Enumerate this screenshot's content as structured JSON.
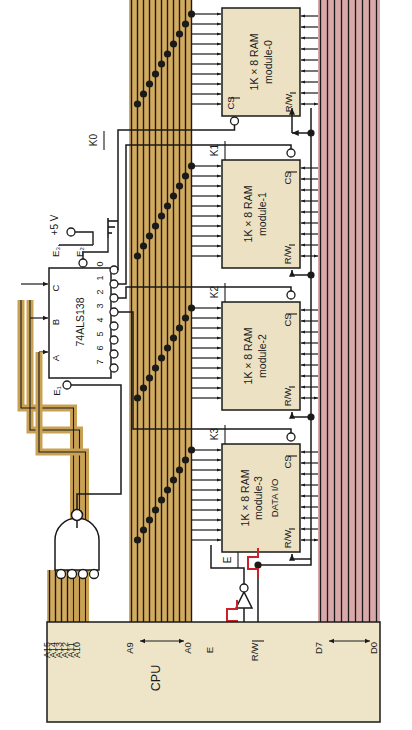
{
  "figure": {
    "type": "digital-logic-schematic",
    "orientation": "rotated 90 degrees counter-clockwise",
    "background_color": "#ffffff"
  },
  "colors": {
    "address_bus": "#d2ab5e",
    "address_bus_alt": "#c9a154",
    "data_bus": "#d9a8a8",
    "chip_fill": "#ede1c3",
    "cpu_fill": "#eee4c8",
    "wire": "#1a1a1a",
    "waveform": "#cc2127",
    "white": "#ffffff"
  },
  "cpu": {
    "label": "CPU",
    "address_high_pins": [
      "A15",
      "A14",
      "A13",
      "A12",
      "A11",
      "A10"
    ],
    "address_low_range": {
      "from": "A9",
      "to": "A0"
    },
    "control_pins": [
      "E",
      "R/W"
    ],
    "data_range": {
      "from": "D7",
      "to": "D0"
    }
  },
  "decoder": {
    "part": "74ALS138",
    "select_inputs": [
      "A",
      "B",
      "C"
    ],
    "enable_inputs": [
      "E1",
      "E2",
      "E3"
    ],
    "outputs": [
      "0",
      "1",
      "2",
      "3",
      "4",
      "5",
      "6",
      "7"
    ],
    "supply_label": "+5 V",
    "ground_label": "ground"
  },
  "select_lines": [
    {
      "name": "K0",
      "overbar": true
    },
    {
      "name": "K1",
      "overbar": true
    },
    {
      "name": "K2",
      "overbar": true
    },
    {
      "name": "K3",
      "overbar": true
    }
  ],
  "ram_modules": [
    {
      "title": "1K × 8 RAM",
      "subtitle": "module-0",
      "cs_pin": "CS",
      "rw_pin": "R/W",
      "data_label": ""
    },
    {
      "title": "1K × 8 RAM",
      "subtitle": "module-1",
      "cs_pin": "CS",
      "rw_pin": "R/W",
      "data_label": ""
    },
    {
      "title": "1K × 8 RAM",
      "subtitle": "module-2",
      "cs_pin": "CS",
      "rw_pin": "R/W",
      "data_label": ""
    },
    {
      "title": "1K × 8 RAM",
      "subtitle": "module-3",
      "cs_pin": "CS",
      "rw_pin": "R/W",
      "data_label": "DATA I/O"
    }
  ],
  "gates": {
    "nand": {
      "inputs": 4,
      "inverted_inputs": true,
      "inverted_output": true
    },
    "inverter": {
      "input_label": "E",
      "input_overbar": true,
      "output_label": "E"
    }
  },
  "waveforms": {
    "input_pulse": "E (active-low pulse)",
    "output_pulse": "E (active-high pulse)"
  }
}
